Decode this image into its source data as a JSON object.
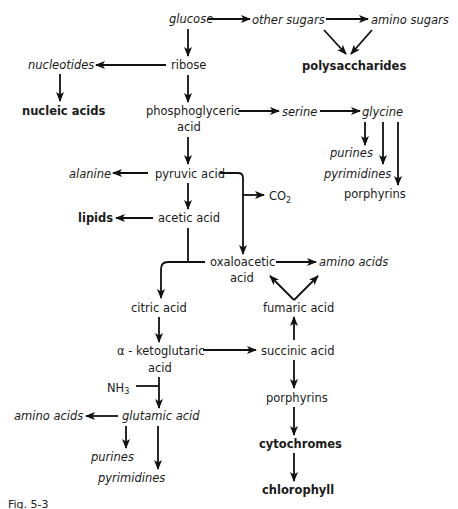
{
  "nodes": {
    "glucose": "glucose",
    "other_sugars": "other sugars",
    "amino_sugars": "amino sugars",
    "polysaccharides": "polysaccharides",
    "nucleotides": "nucleotides",
    "ribose": "ribose",
    "nucleic_acids": "nucleic acids",
    "phosphoglyceric_1": "phosphoglyceric",
    "phosphoglyceric_2": "acid",
    "serine": "serine",
    "glycine": "glycine",
    "purines_top": "purines",
    "pyrimidines_top": "pyrimidines",
    "porphyrins_top": "porphyrins",
    "alanine": "alanine",
    "pyruvic_acid": "pyruvic acid",
    "co2": "CO",
    "co2_sub": "2",
    "lipids": "lipids",
    "acetic_acid": "acetic acid",
    "oxaloacetic_1": "oxaloacetic",
    "oxaloacetic_2": "acid",
    "amino_acids_right": "amino acids",
    "citric_acid": "citric acid",
    "fumaric_acid": "fumaric acid",
    "ketoglutaric_1": "α - ketoglutaric",
    "ketoglutaric_2": "acid",
    "succinic_acid": "succinic acid",
    "nh3": "NH",
    "nh3_sub": "3",
    "amino_acids_left": "amino acids",
    "glutamic_acid": "glutamic acid",
    "purines_bottom": "purines",
    "pyrimidines_bottom": "pyrimidines",
    "porphyrins_bottom": "porphyrins",
    "cytochromes": "cytochromes",
    "chlorophyll": "chlorophyll"
  },
  "caption": "Fig. 5-3"
}
